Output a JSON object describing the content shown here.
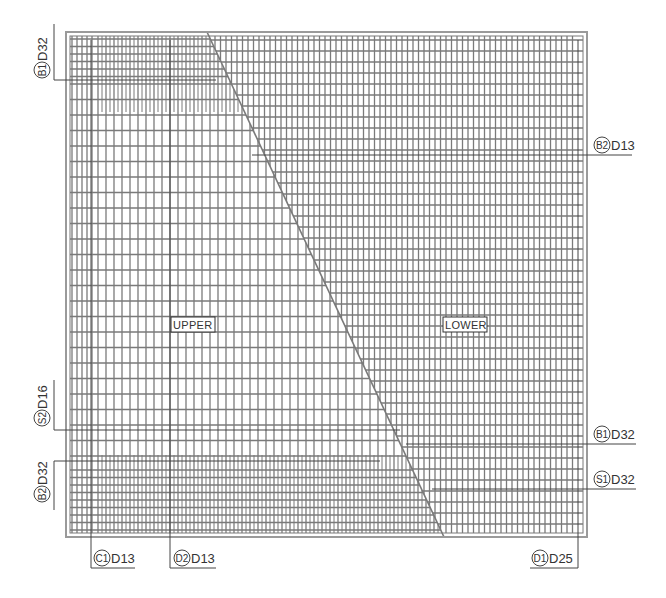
{
  "drawing": {
    "frame": {
      "x1": 66,
      "y1": 32,
      "x2": 587,
      "y2": 537
    },
    "inner": {
      "x1": 70,
      "y1": 36,
      "x2": 583,
      "y2": 533
    },
    "diagonal": {
      "x1": 207,
      "y1": 32,
      "x2": 444,
      "y2": 537
    },
    "colors": {
      "bar": "#7a7a7a",
      "frame": "#9a9a9a",
      "dashed": "#222222",
      "text": "#333333"
    },
    "regions": [
      {
        "name": "upper",
        "label": "UPPER",
        "x": 172,
        "y": 318
      },
      {
        "name": "lower",
        "label": "LOWER",
        "x": 444,
        "y": 318
      }
    ],
    "upper_zone": {
      "vertical_pitch": 8,
      "horizontal_pitch": 15.5,
      "dense_left_cols_pitch": 5
    },
    "lower_zone": {
      "vertical_pitch": 5.5,
      "horizontal_pitch": 11
    },
    "rebar_callouts": [
      {
        "id": "b1-top-left",
        "mark": "B1",
        "size": "D32",
        "side": "left",
        "rot": true,
        "text_x": 42,
        "text_y": 38,
        "leader": [
          [
            54,
            24
          ],
          [
            54,
            80
          ],
          [
            216,
            80
          ]
        ]
      },
      {
        "id": "b2-right",
        "mark": "B2",
        "size": "D13",
        "side": "right",
        "rot": false,
        "text_x": 594,
        "text_y": 145,
        "leader": [
          [
            252,
            155
          ],
          [
            632,
            155
          ]
        ]
      },
      {
        "id": "s2-left",
        "mark": "S2",
        "size": "D16",
        "side": "left",
        "rot": true,
        "text_x": 42,
        "text_y": 386,
        "leader": [
          [
            54,
            380
          ],
          [
            54,
            430
          ],
          [
            400,
            430
          ]
        ]
      },
      {
        "id": "b1-right",
        "mark": "B1",
        "size": "D32",
        "side": "right",
        "rot": false,
        "text_x": 594,
        "text_y": 434,
        "leader": [
          [
            406,
            444
          ],
          [
            636,
            444
          ]
        ]
      },
      {
        "id": "b2-left",
        "mark": "B2",
        "size": "D32",
        "side": "left",
        "rot": true,
        "text_x": 42,
        "text_y": 462,
        "leader": [
          [
            54,
            510
          ],
          [
            54,
            461
          ],
          [
            380,
            461
          ]
        ]
      },
      {
        "id": "s1-right",
        "mark": "S1",
        "size": "D32",
        "side": "right",
        "rot": false,
        "text_x": 594,
        "text_y": 479,
        "leader": [
          [
            432,
            489
          ],
          [
            636,
            489
          ]
        ]
      },
      {
        "id": "c1-bottom",
        "mark": "C1",
        "size": "D13",
        "side": "bottom",
        "rot": false,
        "text_x": 94,
        "text_y": 558,
        "leader": [
          [
            91,
            40
          ],
          [
            91,
            568
          ],
          [
            135,
            568
          ]
        ]
      },
      {
        "id": "d2-bottom",
        "mark": "D2",
        "size": "D13",
        "side": "bottom",
        "rot": false,
        "text_x": 174,
        "text_y": 558,
        "leader": [
          [
            170,
            40
          ],
          [
            170,
            568
          ],
          [
            216,
            568
          ]
        ]
      },
      {
        "id": "d1-bottom",
        "mark": "D1",
        "size": "D25",
        "side": "bottom",
        "rot": false,
        "text_x": 532,
        "text_y": 558,
        "leader": [
          [
            578,
            40
          ],
          [
            578,
            568
          ],
          [
            530,
            568
          ]
        ]
      }
    ]
  }
}
